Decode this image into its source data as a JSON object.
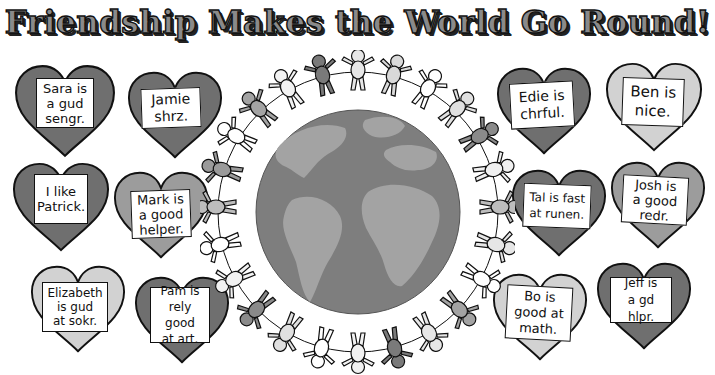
{
  "title": "Friendship Makes the World Go Round!",
  "colors": {
    "heart_dark": "#6f6f6f",
    "heart_medium": "#9c9c9c",
    "heart_light": "#d2d2d2",
    "ocean": "#7e7e7e",
    "land": "#a3a3a3",
    "outline": "#111111"
  },
  "hearts": [
    {
      "name": "Sara",
      "text": "Sara is\na gud\nsengr.",
      "shade": "dark"
    },
    {
      "name": "Jamie",
      "text": "Jamie\nshrz.",
      "shade": "dark"
    },
    {
      "name": "Patrick",
      "text": "I like\nPatrick.",
      "shade": "dark"
    },
    {
      "name": "Mark",
      "text": "Mark is\na good\nhelper.",
      "shade": "medium"
    },
    {
      "name": "Elizabeth",
      "text": "Elizabeth\nis gud\nat sokr.",
      "shade": "light"
    },
    {
      "name": "Pam",
      "text": "Pam is\nrely good\nat art.",
      "shade": "dark"
    },
    {
      "name": "Edie",
      "text": "Edie is\nchrful.",
      "shade": "dark"
    },
    {
      "name": "Ben",
      "text": "Ben is\nnice.",
      "shade": "light"
    },
    {
      "name": "Tal",
      "text": "Tal is fast\nat runen.",
      "shade": "dark"
    },
    {
      "name": "Josh",
      "text": "Josh is\na good\nredr.",
      "shade": "medium"
    },
    {
      "name": "Bo",
      "text": "Bo is\ngood at\nmath.",
      "shade": "light"
    },
    {
      "name": "Jeff",
      "text": "Jeff is\na gd hlpr.",
      "shade": "dark"
    }
  ],
  "center": {
    "globe": "earth-globe",
    "people_ring": "paper-doll-chain"
  }
}
